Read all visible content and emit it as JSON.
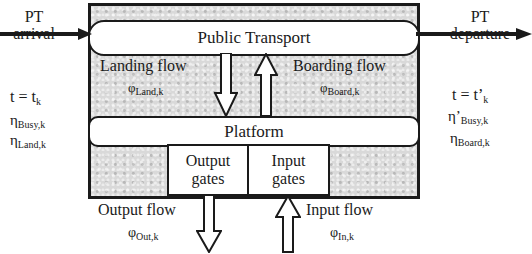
{
  "diagram": {
    "boxes": {
      "public_transport": "Public Transport",
      "platform": "Platform",
      "output_gates": [
        "Output",
        "gates"
      ],
      "input_gates": [
        "Input",
        "gates"
      ]
    },
    "flows": {
      "landing": {
        "label": "Landing flow",
        "symbol": "φ",
        "sub": "Land,k"
      },
      "boarding": {
        "label": "Boarding flow",
        "symbol": "φ",
        "sub": "Board,k"
      },
      "output": {
        "label": "Output flow",
        "symbol": "φ",
        "sub": "Out,k"
      },
      "input": {
        "label": "Input flow",
        "symbol": "φ",
        "sub": "In,k"
      }
    },
    "arrival": {
      "label": [
        "PT",
        "arrival"
      ],
      "time": {
        "t": "t = t",
        "sub": "k"
      },
      "params": [
        {
          "symbol": "η",
          "sub": "Busy,k"
        },
        {
          "symbol": "η",
          "sub": "Land,k"
        }
      ]
    },
    "departure": {
      "label": [
        "PT",
        "departure"
      ],
      "time": {
        "t": "t = t’",
        "sub": "k"
      },
      "params": [
        {
          "symbol": "η’",
          "sub": "Busy,k"
        },
        {
          "symbol": "η",
          "sub": "Board,k"
        }
      ]
    }
  }
}
